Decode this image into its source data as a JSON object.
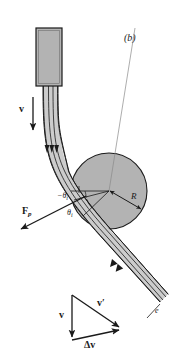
{
  "figure": {
    "panel_label": "(b)"
  },
  "colors": {
    "line": "#1a1a1a",
    "fill_gray": "#b3b3b3",
    "jet_gray": "#cccccc",
    "background": "#ffffff",
    "thin_line": "#8a8a8a"
  },
  "labels": {
    "incoming_velocity": {
      "symbol": "v",
      "subscript": ""
    },
    "plate_force": {
      "symbol": "F",
      "subscript": "p"
    },
    "radius": {
      "symbol": "R"
    },
    "angle_upper": {
      "symbol": "−θ",
      "subscript": "i"
    },
    "angle_lower": {
      "symbol": "θ",
      "subscript": "i"
    },
    "exit_label": {
      "symbol": "e"
    }
  },
  "velocity_triangle": {
    "incoming": "v",
    "outgoing": "v′",
    "change": "Δv"
  },
  "geometry": {
    "cylinder": {
      "cx": 109,
      "cy": 191,
      "r": 38
    },
    "nozzle": {
      "x": 36,
      "y": 28,
      "w": 26,
      "h": 58
    }
  }
}
